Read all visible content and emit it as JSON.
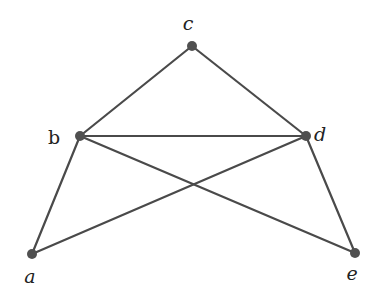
{
  "diagram": {
    "type": "graph",
    "directed": false,
    "colors": {
      "edge": "#4a4a4a",
      "node": "#505050",
      "label": "#222222",
      "background": "#ffffff"
    },
    "nodes": [
      {
        "id": "a",
        "label": "a",
        "x": 32,
        "y": 254,
        "label_x": 30,
        "label_y": 276
      },
      {
        "id": "b",
        "label": "b",
        "x": 80,
        "y": 136,
        "label_x": 54,
        "label_y": 137
      },
      {
        "id": "c",
        "label": "c",
        "x": 192,
        "y": 46,
        "label_x": 188,
        "label_y": 23
      },
      {
        "id": "d",
        "label": "d",
        "x": 306,
        "y": 136,
        "label_x": 320,
        "label_y": 134
      },
      {
        "id": "e",
        "label": "e",
        "x": 355,
        "y": 253,
        "label_x": 352,
        "label_y": 273
      }
    ],
    "edges": [
      {
        "from": "c",
        "to": "b"
      },
      {
        "from": "c",
        "to": "d"
      },
      {
        "from": "b",
        "to": "d"
      },
      {
        "from": "b",
        "to": "a"
      },
      {
        "from": "b",
        "to": "e"
      },
      {
        "from": "d",
        "to": "a"
      },
      {
        "from": "d",
        "to": "e"
      }
    ]
  }
}
